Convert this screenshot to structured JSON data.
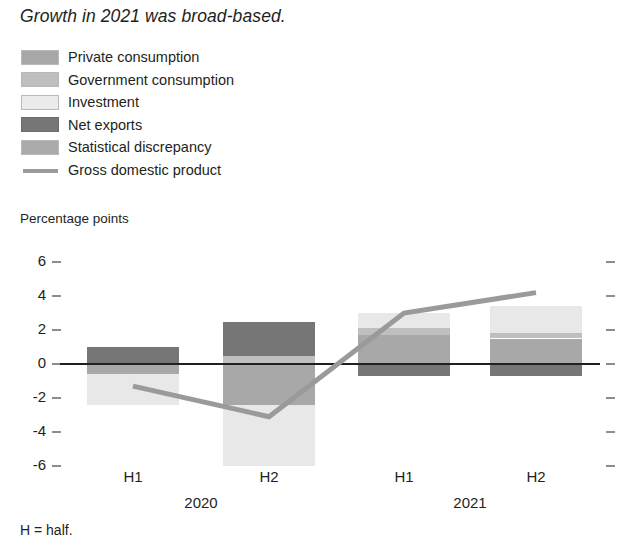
{
  "title": "Growth in 2021 was broad-based.",
  "footnote": "H = half.",
  "axis_caption": "Percentage points",
  "legend": [
    {
      "label": "Private consumption",
      "key": "private_consumption",
      "color": "#a8a8a8",
      "marker": "swatch"
    },
    {
      "label": "Government consumption",
      "key": "government_consumption",
      "color": "#bfbfbf",
      "marker": "swatch"
    },
    {
      "label": "Investment",
      "key": "investment",
      "color": "#e8e8e8",
      "marker": "swatch"
    },
    {
      "label": "Net exports",
      "key": "net_exports",
      "color": "#767676",
      "marker": "swatch"
    },
    {
      "label": "Statistical discrepancy",
      "key": "statistical_discrepancy",
      "color": "#ababab",
      "marker": "swatch"
    },
    {
      "label": "Gross domestic product",
      "key": "gross_domestic_product",
      "color": "#9a9a9a",
      "marker": "line"
    }
  ],
  "chart_data": {
    "type": "bar",
    "stacked": true,
    "title": "Growth in 2021 was broad-based.",
    "xlabel": "",
    "ylabel": "Percentage points",
    "ylim": [
      -6.8,
      6.8
    ],
    "yticks": [
      6,
      4,
      2,
      0,
      -2,
      -4,
      -6
    ],
    "ytick_labels": [
      "6",
      "4",
      "2",
      "0",
      "-2",
      "-4",
      "-6"
    ],
    "grid": false,
    "legend_position": "top-left",
    "categories": [
      "H1",
      "H2",
      "H1",
      "H2"
    ],
    "group_labels": [
      "2020",
      "2021"
    ],
    "series": [
      {
        "name": "Private consumption",
        "color": "#a8a8a8",
        "values": [
          -0.6,
          -2.4,
          1.7,
          1.5
        ]
      },
      {
        "name": "Government consumption",
        "color": "#bfbfbf",
        "values": [
          0.0,
          0.5,
          0.4,
          0.3
        ]
      },
      {
        "name": "Investment",
        "color": "#e8e8e8",
        "values": [
          -1.8,
          -3.6,
          0.9,
          1.6
        ]
      },
      {
        "name": "Net exports",
        "color": "#767676",
        "values": [
          1.0,
          2.0,
          -0.7,
          -0.7
        ]
      },
      {
        "name": "Statistical discrepancy",
        "color": "#ababab",
        "values": [
          0.0,
          0.0,
          0.0,
          0.0
        ]
      }
    ],
    "line_series": {
      "name": "Gross domestic product",
      "color": "#9a9a9a",
      "values": [
        -1.3,
        -3.1,
        3.0,
        4.2
      ]
    }
  },
  "colors": {
    "axis": "#231f20",
    "tick": "#8d8d8d",
    "background": "#ffffff",
    "gdp_line": "#9a9a9a"
  }
}
